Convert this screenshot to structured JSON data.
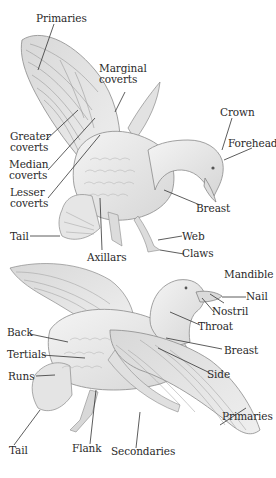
{
  "diagram": {
    "upper_view": {
      "labels": [
        {
          "id": "primaries",
          "lines": [
            "Primaries"
          ]
        },
        {
          "id": "marginal_coverts",
          "lines": [
            "Marginal",
            "coverts"
          ]
        },
        {
          "id": "crown",
          "lines": [
            "Crown"
          ]
        },
        {
          "id": "forehead",
          "lines": [
            "Forehead"
          ]
        },
        {
          "id": "greater_coverts",
          "lines": [
            "Greater",
            "coverts"
          ]
        },
        {
          "id": "median_coverts",
          "lines": [
            "Median",
            "coverts"
          ]
        },
        {
          "id": "lesser_coverts",
          "lines": [
            "Lesser",
            "coverts"
          ]
        },
        {
          "id": "breast",
          "lines": [
            "Breast"
          ]
        },
        {
          "id": "tail",
          "lines": [
            "Tail"
          ]
        },
        {
          "id": "web",
          "lines": [
            "Web"
          ]
        },
        {
          "id": "claws",
          "lines": [
            "Claws"
          ]
        },
        {
          "id": "axillars",
          "lines": [
            "Axillars"
          ]
        }
      ]
    },
    "lower_view": {
      "labels": [
        {
          "id": "mandible",
          "lines": [
            "Mandible"
          ]
        },
        {
          "id": "nail",
          "lines": [
            "Nail"
          ]
        },
        {
          "id": "nostril",
          "lines": [
            "Nostril"
          ]
        },
        {
          "id": "back",
          "lines": [
            "Back"
          ]
        },
        {
          "id": "throat",
          "lines": [
            "Throat"
          ]
        },
        {
          "id": "tertials",
          "lines": [
            "Tertials"
          ]
        },
        {
          "id": "breast",
          "lines": [
            "Breast"
          ]
        },
        {
          "id": "side",
          "lines": [
            "Side"
          ]
        },
        {
          "id": "runs",
          "lines": [
            "Runs"
          ]
        },
        {
          "id": "primaries",
          "lines": [
            "Primaries"
          ]
        },
        {
          "id": "tail",
          "lines": [
            "Tail"
          ]
        },
        {
          "id": "flank",
          "lines": [
            "Flank"
          ]
        },
        {
          "id": "secondaries",
          "lines": [
            "Secondaries"
          ]
        }
      ]
    },
    "colors": {
      "background": "#ffffff",
      "feather_fill": "#e4e4e4",
      "feather_stroke": "#8a8a8a",
      "body_fill": "#ececec",
      "leader_line": "#333333",
      "text": "#2a2a2a"
    }
  }
}
